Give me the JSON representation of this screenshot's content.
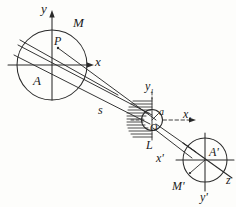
{
  "figure": {
    "stroke_color": "#2a2a2a",
    "background_color": "#fdfdfb",
    "object_plane": {
      "circle_label": "A",
      "rim_label": "M",
      "point_label": "P",
      "axis_y": "y",
      "axis_x": "x"
    },
    "aperture": {
      "center_label": "O",
      "radius_label": "a",
      "screen_label": "L",
      "axis_y1": "y",
      "axis_y1_sub": "1",
      "axis_x1": "x",
      "axis_x1_sub": "1"
    },
    "distance_label": "s",
    "image_plane": {
      "circle_label": "A'",
      "rim_label": "M'",
      "axis_x": "x'",
      "axis_y": "y'",
      "axis_z": "z"
    }
  }
}
